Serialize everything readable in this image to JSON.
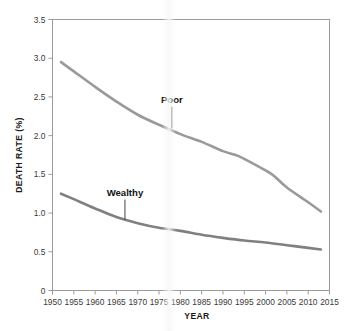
{
  "chart_data": {
    "type": "line",
    "title": "",
    "xlabel": "YEAR",
    "ylabel": "DEATH RATE (%)",
    "xlim": [
      1950,
      2015
    ],
    "ylim": [
      0,
      3.5
    ],
    "xticks": [
      1950,
      1955,
      1960,
      1965,
      1970,
      1975,
      1980,
      1985,
      1990,
      1995,
      2000,
      2005,
      2010,
      2015
    ],
    "yticks": [
      "0",
      "0.5",
      "1.0",
      "1.5",
      "2.0",
      "2.5",
      "3.0",
      "3.5"
    ],
    "ytick_values": [
      0,
      0.5,
      1.0,
      1.5,
      2.0,
      2.5,
      3.0,
      3.5
    ],
    "grid": false,
    "legend_position": "inline-annotation",
    "series": [
      {
        "name": "Poor",
        "color": "#9a9a9a",
        "label_x": 1978,
        "label_y": 2.42,
        "leader_to_y": 2.08,
        "x": [
          1952,
          1955,
          1960,
          1965,
          1970,
          1975,
          1980,
          1985,
          1990,
          1993,
          1995,
          2000,
          2002,
          2005,
          2010,
          2013
        ],
        "values": [
          2.95,
          2.83,
          2.63,
          2.44,
          2.27,
          2.14,
          2.02,
          1.92,
          1.8,
          1.75,
          1.7,
          1.55,
          1.48,
          1.33,
          1.14,
          1.02
        ]
      },
      {
        "name": "Wealthy",
        "color": "#808080",
        "label_x": 1967,
        "label_y": 1.22,
        "leader_to_y": 0.9,
        "x": [
          1952,
          1955,
          1960,
          1965,
          1970,
          1975,
          1980,
          1985,
          1990,
          1995,
          2000,
          2005,
          2010,
          2013
        ],
        "values": [
          1.25,
          1.18,
          1.06,
          0.95,
          0.87,
          0.81,
          0.77,
          0.72,
          0.68,
          0.645,
          0.62,
          0.585,
          0.55,
          0.53
        ]
      }
    ]
  },
  "axes": {
    "x_title": "YEAR",
    "y_title": "DEATH RATE (%)"
  }
}
